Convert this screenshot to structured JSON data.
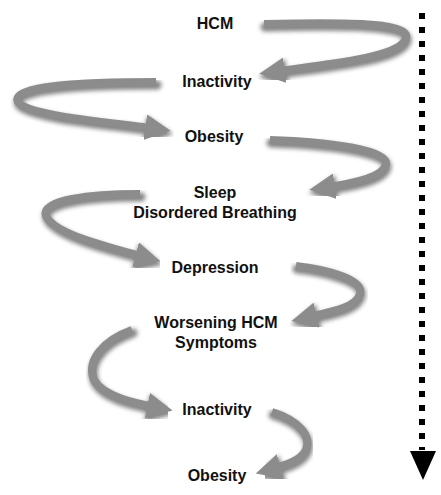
{
  "diagram": {
    "type": "downward spiral flow",
    "steps": [
      {
        "label": "HCM"
      },
      {
        "label": "Inactivity"
      },
      {
        "label": "Obesity"
      },
      {
        "label": "Sleep\nDisordered Breathing",
        "line1": "Sleep",
        "line2": "Disordered Breathing"
      },
      {
        "label": "Depression"
      },
      {
        "label": "Worsening HCM\nSymptoms",
        "line1": "Worsening HCM",
        "line2": "Symptoms"
      },
      {
        "label": "Inactivity"
      },
      {
        "label": "Obesity"
      }
    ],
    "progression_indicator": "dotted-down-arrow",
    "colors": {
      "arrow": "#8c8c8c",
      "arrow_shadow": "#2a2a2a",
      "text": "#111111",
      "dotted_line": "#000000"
    }
  }
}
